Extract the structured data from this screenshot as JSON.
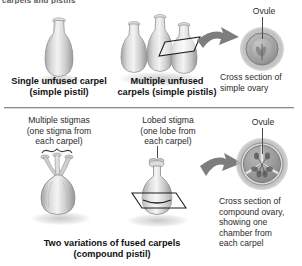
{
  "figure": {
    "title_sliver": "carpels and pistils",
    "background_color": "#ffffff",
    "divider_color": "#8d8d8d",
    "ink_color": "#231f20",
    "tissue_color": "#9c9c9c",
    "arrow_color": "#7a7a7a"
  },
  "top_panel": {
    "items": [
      {
        "id": "single-unfused-carpel",
        "caption": "Single unfused carpel\n(simple pistil)",
        "structure": "single vase-shaped carpel"
      },
      {
        "id": "multiple-unfused-carpels",
        "caption": "Multiple unfused\ncarpels (simple pistils)",
        "structure": "three separate vase-shaped carpels",
        "carpel_count": 3,
        "cut_plane": "parallelogram slicing plane through one carpel"
      }
    ],
    "cross_section": {
      "ovule_label": "Ovule",
      "caption": "Cross section of\nsimple ovary",
      "chamber_count": 1
    },
    "arrow": "curved-arrow-right"
  },
  "bottom_panel": {
    "items": [
      {
        "id": "multiple-stigmas",
        "label": "Multiple stigmas\n(one stigma from\neach carpel)",
        "stigma_count": 3,
        "bracket": true
      },
      {
        "id": "lobed-stigma",
        "label": "Lobed stigma\n(one lobe from\neach carpel)",
        "lobe_count": 3,
        "cut_plane": "parallelogram slicing plane through ovary"
      }
    ],
    "caption": "Two variations of fused carpels\n(compound pistil)",
    "cross_section": {
      "ovule_label": "Ovule",
      "caption": "Cross section of\ncompound ovary,\nshowing one\nchamber from\neach carpel",
      "chamber_count": 3
    },
    "arrow": "curved-arrow-right"
  }
}
